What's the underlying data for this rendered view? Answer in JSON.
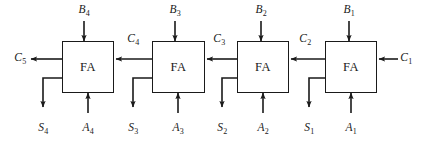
{
  "figure": {
    "kind": "ripple-carry-adder-block-diagram",
    "width": 423,
    "height": 143,
    "background": "#ffffff",
    "line_color": "#1a1a1a",
    "text_color": "#1a1a1a"
  },
  "blocks": [
    {
      "id": "fa4",
      "label": "FA",
      "x": 62,
      "y": 41,
      "w": 52,
      "h": 52
    },
    {
      "id": "fa3",
      "label": "FA",
      "x": 152,
      "y": 41,
      "w": 53,
      "h": 52
    },
    {
      "id": "fa2",
      "label": "FA",
      "x": 237,
      "y": 41,
      "w": 52,
      "h": 52
    },
    {
      "id": "fa1",
      "label": "FA",
      "x": 325,
      "y": 41,
      "w": 52,
      "h": 52
    }
  ],
  "labels": {
    "b_inputs": [
      {
        "name": "B4",
        "base": "B",
        "sub": "4",
        "x": 84,
        "y": 10
      },
      {
        "name": "B3",
        "base": "B",
        "sub": "3",
        "x": 175,
        "y": 10
      },
      {
        "name": "B2",
        "base": "B",
        "sub": "2",
        "x": 261,
        "y": 10
      },
      {
        "name": "B1",
        "base": "B",
        "sub": "1",
        "x": 349,
        "y": 10
      }
    ],
    "a_inputs": [
      {
        "name": "A4",
        "base": "A",
        "sub": "4",
        "x": 88,
        "y": 128
      },
      {
        "name": "A3",
        "base": "A",
        "sub": "3",
        "x": 178,
        "y": 128
      },
      {
        "name": "A2",
        "base": "A",
        "sub": "2",
        "x": 263,
        "y": 128
      },
      {
        "name": "A1",
        "base": "A",
        "sub": "1",
        "x": 351,
        "y": 128
      }
    ],
    "sum_outputs": [
      {
        "name": "S4",
        "base": "S",
        "sub": "4",
        "x": 43,
        "y": 128
      },
      {
        "name": "S3",
        "base": "S",
        "sub": "3",
        "x": 133,
        "y": 128
      },
      {
        "name": "S2",
        "base": "S",
        "sub": "2",
        "x": 222,
        "y": 128
      },
      {
        "name": "S1",
        "base": "S",
        "sub": "1",
        "x": 309,
        "y": 128
      }
    ],
    "carries": [
      {
        "name": "C5",
        "base": "C",
        "sub": "5",
        "x": 20,
        "y": 58
      },
      {
        "name": "C4",
        "base": "C",
        "sub": "4",
        "x": 133,
        "y": 39
      },
      {
        "name": "C3",
        "base": "C",
        "sub": "3",
        "x": 219,
        "y": 39
      },
      {
        "name": "C2",
        "base": "C",
        "sub": "2",
        "x": 305,
        "y": 39
      },
      {
        "name": "C1",
        "base": "C",
        "sub": "1",
        "x": 406,
        "y": 58
      }
    ]
  }
}
